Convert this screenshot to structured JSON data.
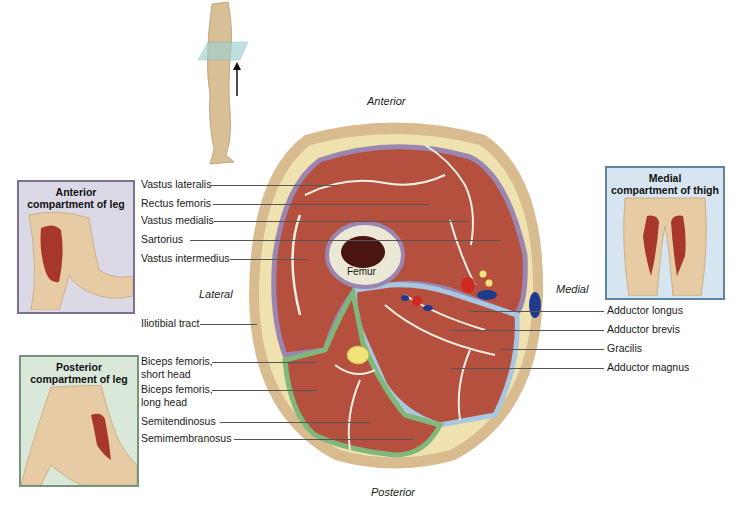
{
  "orientation": {
    "anterior": "Anterior",
    "posterior": "Posterior",
    "lateral": "Lateral",
    "medial": "Medial"
  },
  "bone_label": "Femur",
  "panels": {
    "anterior_leg": {
      "title_line1": "Anterior",
      "title_line2": "compartment of leg",
      "border": "#7a6a8a",
      "bg": "#d9d6e3"
    },
    "posterior_leg": {
      "title_line1": "Posterior",
      "title_line2": "compartment of leg",
      "border": "#6e8f6e",
      "bg": "#d6e7d6"
    },
    "medial_thigh": {
      "title_line1": "Medial",
      "title_line2": "compartment of thigh",
      "border": "#5f86a0",
      "bg": "#d3e3ee"
    }
  },
  "labels_left": [
    {
      "text": "Vastus lateralis"
    },
    {
      "text": "Rectus femoris"
    },
    {
      "text": "Vastus medialis"
    },
    {
      "text": "Sartorius"
    },
    {
      "text": "Vastus intermedius"
    },
    {
      "text": "Iliotibial tract"
    },
    {
      "line1": "Biceps femoris,",
      "line2": "short head"
    },
    {
      "line1": "Biceps femoris,",
      "line2": "long head"
    },
    {
      "text": "Semitendinosus"
    },
    {
      "text": "Semimembranosus"
    }
  ],
  "labels_right": [
    {
      "text": "Adductor longus"
    },
    {
      "text": "Adductor brevis"
    },
    {
      "text": "Gracilis"
    },
    {
      "text": "Adductor magnus"
    }
  ],
  "colors": {
    "muscle": "#b5503f",
    "fat": "#efe3b0",
    "skin": "#d9bf95",
    "anterior_fascia": "#9a86b0",
    "posterior_fascia": "#7fb87a",
    "medial_fascia": "#a8c7e0",
    "artery": "#d02a20",
    "vein": "#1d3a8c",
    "nerve": "#f2e27a"
  }
}
